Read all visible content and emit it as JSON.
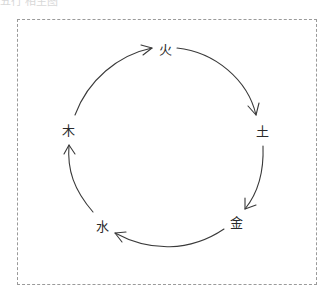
{
  "caption": "五行 相生图",
  "diagram": {
    "type": "cycle",
    "title": "",
    "nodes": [
      {
        "id": "fire",
        "label": "火",
        "x": 165,
        "y": 50
      },
      {
        "id": "earth",
        "label": "土",
        "x": 262,
        "y": 130
      },
      {
        "id": "metal",
        "label": "金",
        "x": 238,
        "y": 222
      },
      {
        "id": "water",
        "label": "水",
        "x": 103,
        "y": 226
      },
      {
        "id": "wood",
        "label": "木",
        "x": 68,
        "y": 130
      }
    ],
    "edges": [
      {
        "from": "fire",
        "to": "earth"
      },
      {
        "from": "earth",
        "to": "metal"
      },
      {
        "from": "metal",
        "to": "water"
      },
      {
        "from": "water",
        "to": "wood"
      },
      {
        "from": "wood",
        "to": "fire"
      }
    ],
    "colors": {
      "stroke": "#3a3a3a",
      "text": "#2a2a2a",
      "border": "#9a9a9a"
    }
  }
}
